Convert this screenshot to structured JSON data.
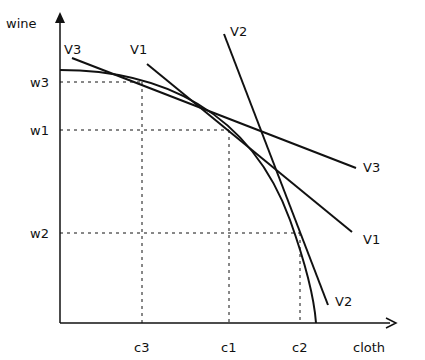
{
  "axes": {
    "y_label": "wine",
    "x_label": "cloth",
    "origin": [
      60,
      323
    ],
    "y_top": 12,
    "x_right": 396
  },
  "y_ticks": [
    {
      "label": "w3",
      "y": 82,
      "x_end": 142
    },
    {
      "label": "w1",
      "y": 130,
      "x_end": 229
    },
    {
      "label": "w2",
      "y": 233,
      "x_end": 300
    }
  ],
  "x_ticks": [
    {
      "label": "c3",
      "x": 142,
      "y_end": 82
    },
    {
      "label": "c1",
      "x": 229,
      "y_end": 130
    },
    {
      "label": "c2",
      "x": 300,
      "y_end": 233
    }
  ],
  "curve": {
    "name": "production possibility frontier",
    "path": "M60,70 C160,70 250,110 290,220 C305,262 314,295 316,323"
  },
  "lines": [
    {
      "label": "V3",
      "x1": 72,
      "y1": 58,
      "x2": 356,
      "y2": 168,
      "label_start": [
        64,
        54
      ],
      "label_end": [
        363,
        172
      ]
    },
    {
      "label": "V1",
      "x1": 147,
      "y1": 64,
      "x2": 352,
      "y2": 232,
      "label_start": [
        130,
        54
      ],
      "label_end": [
        363,
        244
      ]
    },
    {
      "label": "V2",
      "x1": 224,
      "y1": 34,
      "x2": 328,
      "y2": 305,
      "label_start": [
        230,
        36
      ],
      "label_end": [
        335,
        306
      ]
    }
  ],
  "colors": {
    "ink": "#111111",
    "background": "#ffffff"
  }
}
